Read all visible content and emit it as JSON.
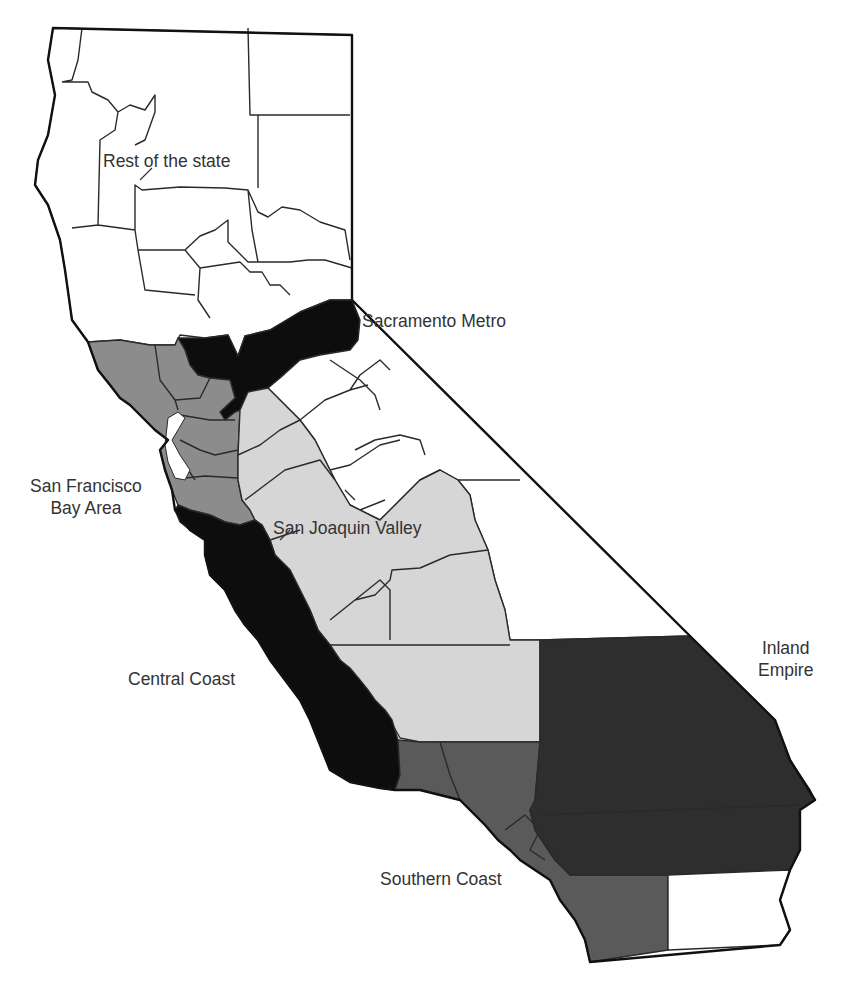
{
  "map": {
    "title": "California regions",
    "regions": [
      {
        "id": "rest",
        "label": "Rest of the state",
        "fill": "#ffffff"
      },
      {
        "id": "sacramento",
        "label": "Sacramento Metro",
        "fill": "#0d0d0d"
      },
      {
        "id": "sf",
        "label_line1": "San Francisco",
        "label_line2": "Bay Area",
        "fill": "#8c8c8c"
      },
      {
        "id": "sjv",
        "label": "San Joaquin Valley",
        "fill": "#d6d6d6"
      },
      {
        "id": "central",
        "label": "Central Coast",
        "fill": "#0d0d0d"
      },
      {
        "id": "inland",
        "label_line1": "Inland",
        "label_line2": "Empire",
        "fill": "#2e2e2e"
      },
      {
        "id": "southern",
        "label": "Southern Coast",
        "fill": "#5a5a5a"
      }
    ]
  }
}
